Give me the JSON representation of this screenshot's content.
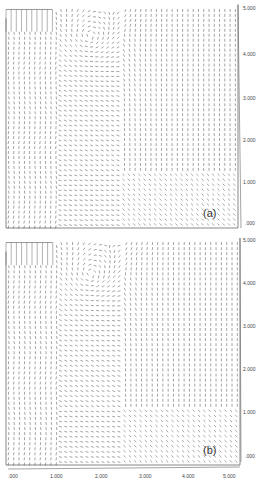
{
  "chart_data": [
    {
      "type": "vector-field",
      "panel_label": "(a)",
      "xlim": [
        0,
        5
      ],
      "ylim": [
        0,
        5
      ],
      "y_ticks": [
        ".000",
        "1.000",
        "2.000",
        "3.000",
        "4.000",
        "5.000"
      ],
      "y_axis_side": "right",
      "features": {
        "inlet_region": {
          "x": [
            0,
            1.0
          ],
          "y": [
            4.4,
            5.0
          ],
          "flow": "vertical lines"
        },
        "recirculation_vortex_center": [
          1.8,
          4.3
        ],
        "dense_region": {
          "x": [
            0,
            1.0
          ],
          "y": [
            1.0,
            4.4
          ]
        },
        "upward_flow_region": {
          "x": [
            2.5,
            5.0
          ],
          "y": [
            0.5,
            5.0
          ]
        }
      }
    },
    {
      "type": "vector-field",
      "panel_label": "(b)",
      "xlim": [
        0,
        5
      ],
      "ylim": [
        0,
        5
      ],
      "x_ticks": [
        ".000",
        "1.000",
        "2.000",
        "3.000",
        "4.000",
        "5.000"
      ],
      "y_ticks": [
        ".000",
        "1.000",
        "2.000",
        "3.000",
        "4.000",
        "5.000"
      ],
      "y_axis_side": "right",
      "features": {
        "inlet_region": {
          "x": [
            0,
            1.0
          ],
          "y": [
            4.4,
            5.0
          ],
          "flow": "vertical lines"
        },
        "recirculation_vortex_center": [
          1.8,
          4.2
        ],
        "dense_region": {
          "x": [
            0,
            1.0
          ],
          "y": [
            1.0,
            4.4
          ]
        },
        "upward_flow_region": {
          "x": [
            2.5,
            5.0
          ],
          "y": [
            0.5,
            5.0
          ]
        }
      }
    }
  ],
  "panels": {
    "a": {
      "label": "(a)"
    },
    "b": {
      "label": "(b)"
    }
  },
  "axis": {
    "y_ticks": [
      ".000",
      "1.000",
      "2.000",
      "3.000",
      "4.000",
      "5.000"
    ],
    "x_ticks": [
      ".000",
      "1.000",
      "2.000",
      "3.000",
      "4.000",
      "5.000"
    ]
  }
}
